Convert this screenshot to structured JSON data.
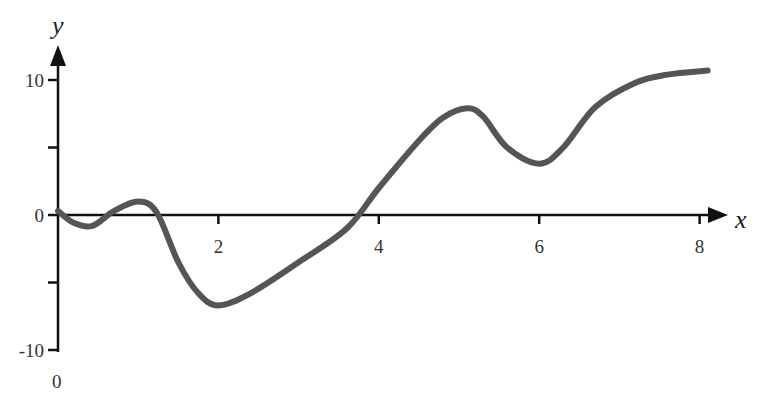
{
  "chart_data": {
    "type": "line",
    "title": "",
    "xlabel": "x",
    "ylabel": "y",
    "xlim": [
      0,
      8.1
    ],
    "ylim": [
      -10,
      11
    ],
    "grid": false,
    "legend": null,
    "x_ticks": [
      "2",
      "4",
      "6",
      "8"
    ],
    "y_ticks": [
      "10",
      "0",
      "-10"
    ],
    "origin_label": "0",
    "series": [
      {
        "name": "curve",
        "color": "#555555",
        "x": [
          0,
          0.2,
          0.43,
          0.7,
          1.0,
          1.23,
          1.5,
          1.75,
          2.0,
          2.4,
          3.0,
          3.6,
          4.0,
          4.5,
          4.8,
          5.1,
          5.3,
          5.6,
          6.0,
          6.3,
          6.7,
          7.2,
          7.6,
          8.1
        ],
        "values": [
          0.3,
          -0.6,
          -0.8,
          0.3,
          1.0,
          0.2,
          -3.5,
          -5.8,
          -6.7,
          -5.8,
          -3.5,
          -1.0,
          2.0,
          5.5,
          7.2,
          7.9,
          7.3,
          5.0,
          3.8,
          5.0,
          8.0,
          9.8,
          10.4,
          10.7
        ]
      }
    ]
  }
}
